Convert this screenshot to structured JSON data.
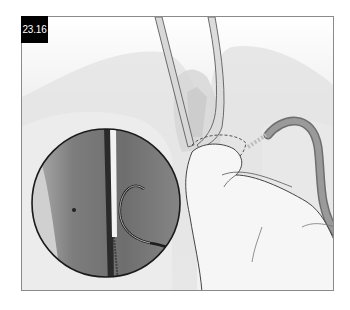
{
  "figure": {
    "label": "23.16",
    "colors": {
      "label_bg": "#000000",
      "label_text": "#ffffff",
      "frame_border": "#8a8a8a",
      "background": "#f4f4f4",
      "tube": "#8c8c8c",
      "inset_tissue": "#7a7a7a"
    }
  }
}
